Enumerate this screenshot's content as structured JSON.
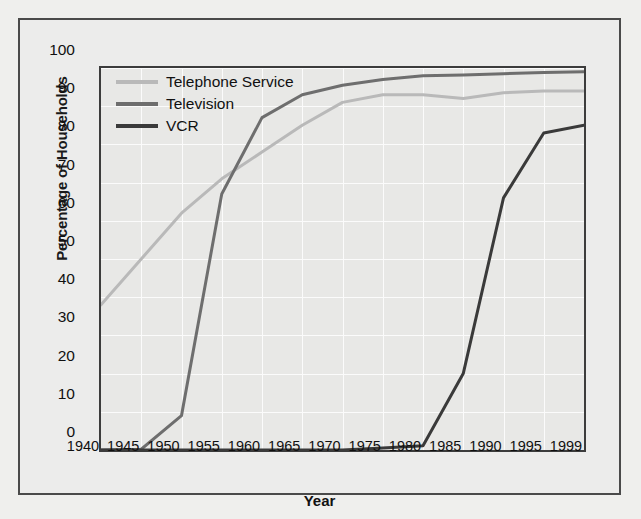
{
  "chart_data": {
    "type": "line",
    "title": "",
    "xlabel": "Year",
    "ylabel": "Percentage of Households",
    "x": [
      1940,
      1945,
      1950,
      1955,
      1960,
      1965,
      1970,
      1975,
      1980,
      1985,
      1990,
      1995,
      1999
    ],
    "xtick_labels": [
      "1940",
      "1945",
      "1950",
      "1955",
      "1960",
      "1965",
      "1970",
      "1975",
      "1980",
      "1985",
      "1990",
      "1995",
      "1999"
    ],
    "ytick_labels": [
      "0",
      "10",
      "20",
      "30",
      "40",
      "50",
      "60",
      "70",
      "80",
      "90",
      "100"
    ],
    "yticks": [
      0,
      10,
      20,
      30,
      40,
      50,
      60,
      70,
      80,
      90,
      100
    ],
    "xlim": [
      1940,
      1999
    ],
    "ylim": [
      0,
      100
    ],
    "grid": true,
    "legend_position": "top-left",
    "series": [
      {
        "name": "Telephone Service",
        "color": "#b9b9b9",
        "width": 3,
        "values": [
          38,
          50,
          62,
          71,
          78,
          85,
          91,
          93,
          93,
          92,
          93.5,
          94,
          94
        ]
      },
      {
        "name": "Television",
        "color": "#6e6e6e",
        "width": 3,
        "values": [
          0,
          0.2,
          9,
          67,
          87,
          93,
          95.5,
          97,
          98,
          98.2,
          98.5,
          98.8,
          99
        ]
      },
      {
        "name": "VCR",
        "color": "#3a3a3a",
        "width": 3,
        "values": [
          0,
          0,
          0,
          0,
          0,
          0,
          0,
          0.5,
          1.1,
          20,
          66,
          83,
          85
        ]
      }
    ]
  },
  "figure": {
    "background": "#efefed",
    "plot_background": "#e8e8e6",
    "frame_color": "#4a4a4a",
    "axis_color": "#3c3c3c",
    "grid_color": "#fbfbfb"
  }
}
